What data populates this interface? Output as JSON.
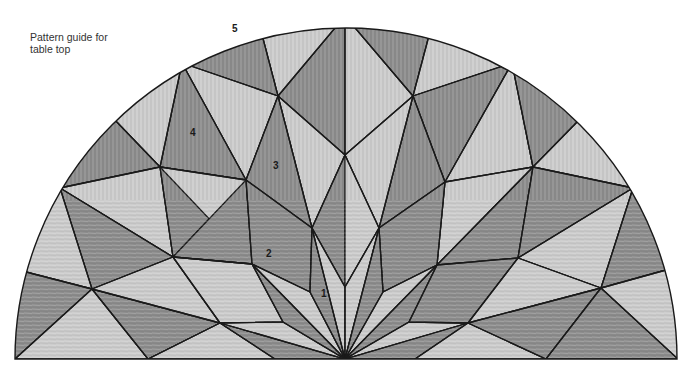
{
  "caption": {
    "line1": "Pattern guide for",
    "line2": "table top"
  },
  "labels": [
    {
      "id": "1",
      "x": 321,
      "y": 297
    },
    {
      "id": "2",
      "x": 269,
      "y": 256
    },
    {
      "id": "3",
      "x": 276,
      "y": 168
    },
    {
      "id": "4",
      "x": 192,
      "y": 135
    },
    {
      "id": "5",
      "x": 235,
      "y": 31
    }
  ],
  "colors": {
    "dark": "#8c8c8c",
    "mid": "#a6a6a6",
    "light": "#cbcbcb",
    "line": "#1a1a1a"
  },
  "geometry": {
    "center": [
      346,
      359
    ],
    "radius": 331
  }
}
